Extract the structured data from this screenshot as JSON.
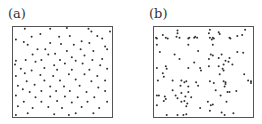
{
  "chart_data": [
    {
      "type": "scatter",
      "title": "(a)",
      "xlabel": "",
      "ylabel": "",
      "xlim": [
        0,
        1
      ],
      "ylim": [
        0,
        1
      ],
      "grid": false,
      "frame": {
        "x": 12,
        "y": 26,
        "w": 100,
        "h": 91
      },
      "marker_color": "#333333",
      "points": [
        [
          0.12,
          0.02
        ],
        [
          0.38,
          0.02
        ],
        [
          0.55,
          0.01
        ],
        [
          0.77,
          0.02
        ],
        [
          0.8,
          0.05
        ],
        [
          0.99,
          0.05
        ],
        [
          0.19,
          0.11
        ],
        [
          0.28,
          0.08
        ],
        [
          0.47,
          0.11
        ],
        [
          0.58,
          0.1
        ],
        [
          0.86,
          0.1
        ],
        [
          0.91,
          0.13
        ],
        [
          0.03,
          0.14
        ],
        [
          0.11,
          0.17
        ],
        [
          0.15,
          0.2
        ],
        [
          0.38,
          0.18
        ],
        [
          0.49,
          0.19
        ],
        [
          0.7,
          0.16
        ],
        [
          0.62,
          0.2
        ],
        [
          0.78,
          0.18
        ],
        [
          0.94,
          0.22
        ],
        [
          0.25,
          0.25
        ],
        [
          0.33,
          0.25
        ],
        [
          0.43,
          0.3
        ],
        [
          0.55,
          0.27
        ],
        [
          0.69,
          0.25
        ],
        [
          0.82,
          0.27
        ],
        [
          0.96,
          0.25
        ],
        [
          0.2,
          0.31
        ],
        [
          0.36,
          0.31
        ],
        [
          0.6,
          0.34
        ],
        [
          0.73,
          0.32
        ],
        [
          0.03,
          0.38
        ],
        [
          0.13,
          0.37
        ],
        [
          0.29,
          0.37
        ],
        [
          0.48,
          0.37
        ],
        [
          0.64,
          0.38
        ],
        [
          0.81,
          0.37
        ],
        [
          0.91,
          0.36
        ],
        [
          0.02,
          0.42
        ],
        [
          0.23,
          0.39
        ],
        [
          0.42,
          0.43
        ],
        [
          0.53,
          0.41
        ],
        [
          0.71,
          0.41
        ],
        [
          0.89,
          0.43
        ],
        [
          0.08,
          0.47
        ],
        [
          0.19,
          0.49
        ],
        [
          0.32,
          0.46
        ],
        [
          0.45,
          0.48
        ],
        [
          0.6,
          0.48
        ],
        [
          0.78,
          0.48
        ],
        [
          0.96,
          0.47
        ],
        [
          0.03,
          0.55
        ],
        [
          0.12,
          0.52
        ],
        [
          0.28,
          0.54
        ],
        [
          0.41,
          0.55
        ],
        [
          0.57,
          0.53
        ],
        [
          0.73,
          0.53
        ],
        [
          0.86,
          0.55
        ],
        [
          0.14,
          0.61
        ],
        [
          0.32,
          0.6
        ],
        [
          0.48,
          0.6
        ],
        [
          0.64,
          0.59
        ],
        [
          0.8,
          0.61
        ],
        [
          0.94,
          0.6
        ],
        [
          0.05,
          0.66
        ],
        [
          0.22,
          0.65
        ],
        [
          0.38,
          0.67
        ],
        [
          0.52,
          0.67
        ],
        [
          0.68,
          0.66
        ],
        [
          0.87,
          0.68
        ],
        [
          0.1,
          0.7
        ],
        [
          0.17,
          0.73
        ],
        [
          0.29,
          0.72
        ],
        [
          0.44,
          0.72
        ],
        [
          0.58,
          0.72
        ],
        [
          0.75,
          0.73
        ],
        [
          0.94,
          0.72
        ],
        [
          0.03,
          0.77
        ],
        [
          0.23,
          0.79
        ],
        [
          0.38,
          0.78
        ],
        [
          0.53,
          0.78
        ],
        [
          0.66,
          0.79
        ],
        [
          0.83,
          0.79
        ],
        [
          0.11,
          0.84
        ],
        [
          0.29,
          0.84
        ],
        [
          0.45,
          0.83
        ],
        [
          0.6,
          0.85
        ],
        [
          0.76,
          0.84
        ],
        [
          0.96,
          0.84
        ],
        [
          0.05,
          0.89
        ],
        [
          0.2,
          0.91
        ],
        [
          0.36,
          0.9
        ],
        [
          0.5,
          0.91
        ],
        [
          0.7,
          0.9
        ],
        [
          0.88,
          0.91
        ],
        [
          0.15,
          0.97
        ],
        [
          0.42,
          0.98
        ],
        [
          0.64,
          0.97
        ],
        [
          0.82,
          0.97
        ],
        [
          0.03,
          0.99
        ],
        [
          0.57,
          0.99
        ]
      ]
    },
    {
      "type": "scatter",
      "title": "(b)",
      "xlabel": "",
      "ylabel": "",
      "xlim": [
        0,
        1
      ],
      "ylim": [
        0,
        1
      ],
      "grid": false,
      "frame": {
        "x": 153,
        "y": 26,
        "w": 100,
        "h": 91
      },
      "marker_color": "#333333",
      "points": [
        [
          0.24,
          0.04
        ],
        [
          0.57,
          0.03
        ],
        [
          0.93,
          0.03
        ],
        [
          0.24,
          0.07
        ],
        [
          0.56,
          0.07
        ],
        [
          0.66,
          0.06
        ],
        [
          0.67,
          0.08
        ],
        [
          0.85,
          0.1
        ],
        [
          0.02,
          0.12
        ],
        [
          0.03,
          0.13
        ],
        [
          0.09,
          0.09
        ],
        [
          0.12,
          0.12
        ],
        [
          0.14,
          0.13
        ],
        [
          0.23,
          0.11
        ],
        [
          0.26,
          0.12
        ],
        [
          0.35,
          0.13
        ],
        [
          0.36,
          0.12
        ],
        [
          0.41,
          0.12
        ],
        [
          0.42,
          0.11
        ],
        [
          0.44,
          0.12
        ],
        [
          0.57,
          0.12
        ],
        [
          0.59,
          0.14
        ],
        [
          0.6,
          0.12
        ],
        [
          0.61,
          0.13
        ],
        [
          0.77,
          0.12
        ],
        [
          0.78,
          0.13
        ],
        [
          0.9,
          0.09
        ],
        [
          0.03,
          0.2
        ],
        [
          0.35,
          0.2
        ],
        [
          0.6,
          0.2
        ],
        [
          0.06,
          0.28
        ],
        [
          0.45,
          0.27
        ],
        [
          0.21,
          0.31
        ],
        [
          0.58,
          0.31
        ],
        [
          0.6,
          0.32
        ],
        [
          0.69,
          0.31
        ],
        [
          0.85,
          0.28
        ],
        [
          0.91,
          0.29
        ],
        [
          0.26,
          0.36
        ],
        [
          0.56,
          0.36
        ],
        [
          0.66,
          0.35
        ],
        [
          0.77,
          0.35
        ],
        [
          0.41,
          0.4
        ],
        [
          0.73,
          0.38
        ],
        [
          0.76,
          0.39
        ],
        [
          0.71,
          0.42
        ],
        [
          0.56,
          0.44
        ],
        [
          0.47,
          0.46
        ],
        [
          0.66,
          0.44
        ],
        [
          0.8,
          0.42
        ],
        [
          0.03,
          0.46
        ],
        [
          0.12,
          0.44
        ],
        [
          0.13,
          0.47
        ],
        [
          0.35,
          0.46
        ],
        [
          0.7,
          0.47
        ],
        [
          0.71,
          0.49
        ],
        [
          0.48,
          0.49
        ],
        [
          0.09,
          0.52
        ],
        [
          0.1,
          0.56
        ],
        [
          0.67,
          0.53
        ],
        [
          0.92,
          0.53
        ],
        [
          0.19,
          0.6
        ],
        [
          0.04,
          0.6
        ],
        [
          0.28,
          0.6
        ],
        [
          0.31,
          0.62
        ],
        [
          0.33,
          0.61
        ],
        [
          0.43,
          0.62
        ],
        [
          0.57,
          0.61
        ],
        [
          0.61,
          0.63
        ],
        [
          0.71,
          0.61
        ],
        [
          0.73,
          0.62
        ],
        [
          0.73,
          0.64
        ],
        [
          0.96,
          0.6
        ],
        [
          0.99,
          0.61
        ],
        [
          0.99,
          0.63
        ],
        [
          0.27,
          0.66
        ],
        [
          0.35,
          0.67
        ],
        [
          0.45,
          0.66
        ],
        [
          0.72,
          0.67
        ],
        [
          0.19,
          0.71
        ],
        [
          0.63,
          0.71
        ],
        [
          0.75,
          0.73
        ],
        [
          0.77,
          0.73
        ],
        [
          0.84,
          0.72
        ],
        [
          0.28,
          0.74
        ],
        [
          0.35,
          0.73
        ],
        [
          0.22,
          0.77
        ],
        [
          0.32,
          0.78
        ],
        [
          0.68,
          0.77
        ],
        [
          0.03,
          0.77
        ],
        [
          0.05,
          0.77
        ],
        [
          0.11,
          0.78
        ],
        [
          0.24,
          0.8
        ],
        [
          0.38,
          0.79
        ],
        [
          0.12,
          0.81
        ],
        [
          0.31,
          0.83
        ],
        [
          0.1,
          0.83
        ],
        [
          0.28,
          0.84
        ],
        [
          0.55,
          0.84
        ],
        [
          0.74,
          0.84
        ],
        [
          0.34,
          0.86
        ],
        [
          0.03,
          0.88
        ],
        [
          0.33,
          0.89
        ],
        [
          0.58,
          0.88
        ],
        [
          0.6,
          0.87
        ],
        [
          0.47,
          0.91
        ],
        [
          0.57,
          0.94
        ],
        [
          0.69,
          0.96
        ],
        [
          0.72,
          0.99
        ],
        [
          0.81,
          0.97
        ],
        [
          0.13,
          0.99
        ],
        [
          0.24,
          0.99
        ],
        [
          0.3,
          0.99
        ],
        [
          0.33,
          0.98
        ]
      ]
    }
  ],
  "panels": [
    {
      "label": "(a)"
    },
    {
      "label": "(b)"
    }
  ]
}
